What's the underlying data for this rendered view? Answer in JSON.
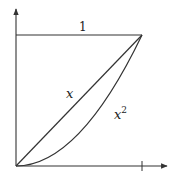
{
  "diagram": {
    "title": "",
    "labels": {
      "top_edge": "1",
      "line_label": "x",
      "curve_label_base": "x",
      "curve_label_exp": "2"
    },
    "elements": [
      {
        "type": "axis",
        "direction": "vertical",
        "arrow": "up"
      },
      {
        "type": "axis",
        "direction": "horizontal",
        "arrow": "right",
        "tick_at": 1
      },
      {
        "type": "segment",
        "from": [
          0,
          1
        ],
        "to": [
          1,
          1
        ],
        "label": "1"
      },
      {
        "type": "curve",
        "function": "y = x",
        "domain": [
          0,
          1
        ],
        "label": "x"
      },
      {
        "type": "curve",
        "function": "y = x^2",
        "domain": [
          0,
          1
        ],
        "label": "x^2"
      }
    ],
    "colors": {
      "stroke": "#333333",
      "background": "#ffffff"
    }
  }
}
